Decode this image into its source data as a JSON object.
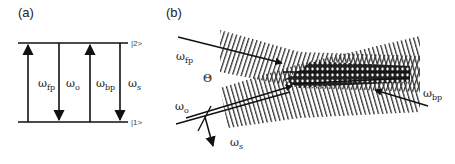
{
  "figure": {
    "panel_a": {
      "label": "(a)",
      "levels": [
        {
          "name": "upper",
          "label": "|2>"
        },
        {
          "name": "lower",
          "label": "|1>"
        }
      ],
      "transitions": [
        {
          "symbol": "ω",
          "sub": "fp",
          "direction": "up"
        },
        {
          "symbol": "ω",
          "sub": "o",
          "direction": "down"
        },
        {
          "symbol": "ω",
          "sub": "bp",
          "direction": "up"
        },
        {
          "symbol": "ω",
          "sub": "s",
          "direction": "down"
        }
      ]
    },
    "panel_b": {
      "label": "(b)",
      "angle_label": "Θ",
      "beams": [
        {
          "symbol": "ω",
          "sub": "fp"
        },
        {
          "symbol": "ω",
          "sub": "o"
        },
        {
          "symbol": "ω",
          "sub": "bp"
        },
        {
          "symbol": "ω",
          "sub": "s"
        }
      ]
    },
    "colors": {
      "line": "#111111",
      "hatch": "#3a3a3a",
      "background": "#ffffff"
    }
  }
}
